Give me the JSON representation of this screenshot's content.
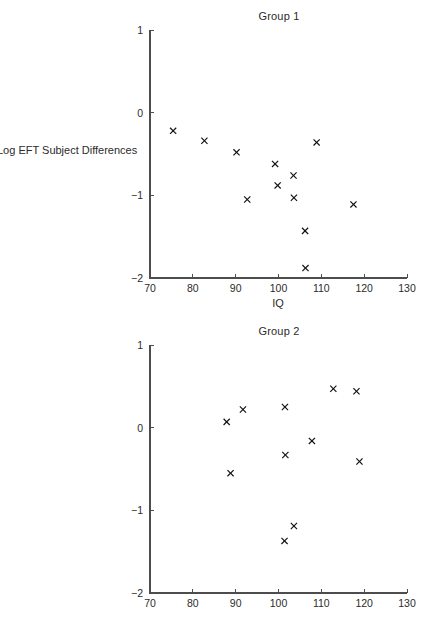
{
  "figure": {
    "background_color": "#ffffff",
    "foreground_color": "#1a1a1a",
    "marker_symbol": "x"
  },
  "panels": [
    {
      "id": "panel-1",
      "title": "Group 1",
      "xlabel": "IQ",
      "ylabel": "Log EFT Subject Differences"
    },
    {
      "id": "panel-2",
      "title": "Group 2",
      "xlabel": "IQ",
      "ylabel": "Log EFT Subject Differences"
    }
  ],
  "axes": {
    "xticks": [
      70,
      80,
      90,
      100,
      110,
      120,
      130
    ],
    "yticks": [
      1,
      0,
      -1,
      -2
    ],
    "xtick_labels": [
      "70",
      "80",
      "90",
      "100",
      "110",
      "120",
      "130"
    ],
    "ytick_labels": [
      "1",
      "0",
      "−1",
      "−2"
    ],
    "xlim": [
      70,
      130
    ],
    "ylim": [
      -2,
      1
    ]
  },
  "chart_data": [
    {
      "type": "scatter",
      "title": "Group 1",
      "xlabel": "IQ",
      "ylabel": "Log EFT Subject Differences",
      "xlim": [
        70,
        130
      ],
      "ylim": [
        -2,
        1
      ],
      "xticks": [
        70,
        80,
        90,
        100,
        110,
        120,
        130
      ],
      "yticks": [
        1,
        0,
        -1,
        -2
      ],
      "grid": false,
      "legend": false,
      "marker": "x",
      "marker_color": "#101010",
      "points": [
        {
          "x": 75.4,
          "y": -0.22
        },
        {
          "x": 82.7,
          "y": -0.34
        },
        {
          "x": 90.2,
          "y": -0.48
        },
        {
          "x": 92.7,
          "y": -1.05
        },
        {
          "x": 99.2,
          "y": -0.62
        },
        {
          "x": 99.8,
          "y": -0.88
        },
        {
          "x": 103.5,
          "y": -0.76
        },
        {
          "x": 103.6,
          "y": -1.03
        },
        {
          "x": 106.2,
          "y": -1.43
        },
        {
          "x": 106.3,
          "y": -1.88
        },
        {
          "x": 108.9,
          "y": -0.36
        },
        {
          "x": 117.5,
          "y": -1.11
        }
      ]
    },
    {
      "type": "scatter",
      "title": "Group 2",
      "xlabel": "IQ",
      "ylabel": "Log EFT Subject Differences",
      "xlim": [
        70,
        130
      ],
      "ylim": [
        -2,
        1
      ],
      "xticks": [
        70,
        80,
        90,
        100,
        110,
        120,
        130
      ],
      "yticks": [
        1,
        0,
        -1,
        -2
      ],
      "grid": false,
      "legend": false,
      "marker": "x",
      "marker_color": "#101010",
      "points": [
        {
          "x": 87.9,
          "y": 0.07
        },
        {
          "x": 88.8,
          "y": -0.55
        },
        {
          "x": 91.7,
          "y": 0.22
        },
        {
          "x": 101.4,
          "y": -1.37
        },
        {
          "x": 101.5,
          "y": 0.25
        },
        {
          "x": 101.6,
          "y": -0.33
        },
        {
          "x": 103.6,
          "y": -1.19
        },
        {
          "x": 107.8,
          "y": -0.16
        },
        {
          "x": 112.8,
          "y": 0.47
        },
        {
          "x": 118.2,
          "y": 0.44
        },
        {
          "x": 118.9,
          "y": -0.41
        }
      ]
    }
  ]
}
